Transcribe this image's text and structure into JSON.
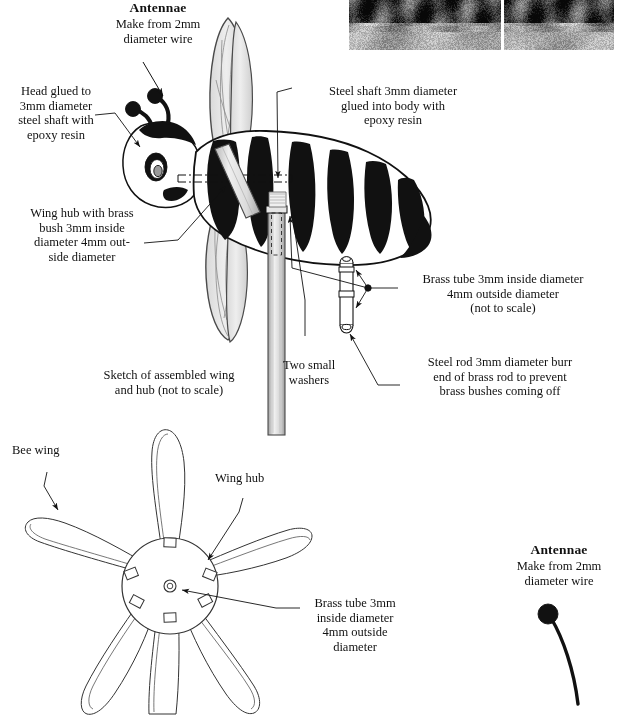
{
  "document": {
    "type": "technical-assembly-diagram",
    "subject": "Garden bee windmill / whirligig construction drawing",
    "background": "#ffffff",
    "ink": "#111111"
  },
  "photos": {
    "count": 2,
    "description": "Two small grayscale garden photographs at top right, partially cropped by the top edge"
  },
  "labels": {
    "antennae_top": {
      "heading": "Antennae",
      "body": "Make from 2mm\ndiameter wire"
    },
    "head": {
      "text": "Head glued to\n3mm diameter\nsteel shaft with\nepoxy resin"
    },
    "steel_shaft": {
      "text": "Steel shaft 3mm diameter\nglued into body with\nepoxy resin"
    },
    "wing_hub_bush": {
      "text": "Wing hub with brass\nbush 3mm inside\ndiameter 4mm out-\nside diameter"
    },
    "brass_tube_upper": {
      "text": "Brass tube 3mm inside diameter\n4mm outside diameter\n(not to scale)"
    },
    "two_washers": {
      "text": "Two small\nwashers"
    },
    "steel_rod_burr": {
      "text": "Steel rod 3mm diameter burr\nend of brass rod to prevent\nbrass bushes coming off"
    },
    "sketch_caption": {
      "text": "Sketch of assembled wing\nand hub (not to scale)"
    },
    "bee_wing": {
      "text": "Bee wing"
    },
    "wing_hub": {
      "text": "Wing hub"
    },
    "brass_tube_lower": {
      "text": "Brass tube 3mm\ninside diameter\n4mm outside\ndiameter"
    },
    "antennae_bottom": {
      "heading": "Antennae",
      "body": "Make from 2mm\ndiameter wire"
    }
  },
  "parts": {
    "bee": "striped bee body with head, eye, antennae, wings and steel shaft",
    "vertical_shaft": "long vertical steel shaft below the bee body",
    "brass_tube_detail": "small brass tube with two washers, drawn not to scale",
    "wing_rosette": "six bee wings mounted radially into a round wing hub",
    "antenna_sample": "single antenna wire with ball end"
  }
}
